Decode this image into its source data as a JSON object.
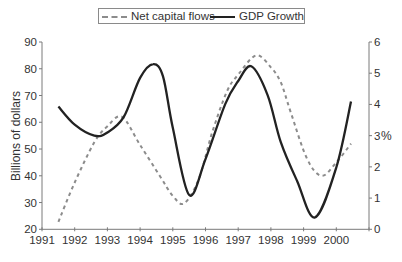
{
  "chart_data": {
    "type": "line",
    "title": "",
    "xlabel": "",
    "ylabel": "Billions of dollars",
    "y2label": "%",
    "x_ticks": [
      1991,
      1992,
      1993,
      1994,
      1995,
      1996,
      1997,
      1998,
      1999,
      2000
    ],
    "xlim": [
      1991,
      2001
    ],
    "ylim": [
      20,
      90
    ],
    "y_ticks": [
      20,
      30,
      40,
      50,
      60,
      70,
      80,
      90
    ],
    "y2lim": [
      0,
      6
    ],
    "y2_ticks": [
      0,
      1,
      2,
      3,
      4,
      5,
      6
    ],
    "grid": false,
    "legend_position": "top-center",
    "legend": [
      "Net capital flows",
      "GDP Growth"
    ],
    "series": [
      {
        "name": "Net capital flows",
        "axis": "left",
        "style": "dashed",
        "color": "#8c8c8c",
        "x": [
          1991.5,
          1992.0,
          1992.6,
          1993.0,
          1993.45,
          1994.0,
          1994.6,
          1995.0,
          1995.35,
          1995.8,
          1996.2,
          1996.65,
          1997.0,
          1997.55,
          1998.0,
          1998.3,
          1998.6,
          1999.1,
          1999.55,
          2000.0,
          2000.45
        ],
        "values": [
          22.8,
          37.5,
          52.5,
          58.5,
          62.0,
          51.5,
          40.0,
          32.5,
          29.7,
          39.0,
          56.0,
          71.4,
          77.8,
          85.0,
          80.5,
          75.0,
          64.0,
          46.5,
          40.0,
          45.0,
          52.0
        ]
      },
      {
        "name": "GDP Growth",
        "axis": "right",
        "style": "solid",
        "color": "#222222",
        "x": [
          1991.5,
          1992.0,
          1992.6,
          1993.0,
          1993.5,
          1994.0,
          1994.4,
          1994.7,
          1995.0,
          1995.5,
          1996.0,
          1996.6,
          1997.0,
          1997.4,
          1997.9,
          1998.3,
          1998.8,
          1999.35,
          2000.0,
          2000.45
        ],
        "values": [
          3.93,
          3.35,
          3.0,
          3.1,
          3.6,
          4.85,
          5.29,
          4.9,
          3.25,
          1.1,
          2.25,
          4.0,
          4.75,
          5.22,
          4.3,
          2.8,
          1.55,
          0.38,
          1.98,
          4.09
        ]
      }
    ]
  },
  "legend": {
    "net_label": "Net capital flows",
    "gdp_label": "GDP Growth"
  },
  "axes": {
    "left_title": "Billions of dollars",
    "right_title": "%",
    "axis_color": "#7a7a7a"
  }
}
